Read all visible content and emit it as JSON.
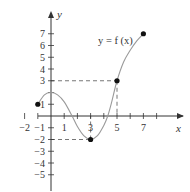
{
  "chart_data": {
    "type": "line",
    "title": "",
    "xlabel": "x",
    "ylabel": "y",
    "curve_label": "y = f (x)",
    "xlim": [
      -2.5,
      8.5
    ],
    "ylim": [
      -5.5,
      8
    ],
    "grid": false,
    "x_tick_labels": [
      "-2",
      "1",
      "3",
      "5",
      "7"
    ],
    "x_ticks": [
      -2,
      -1,
      1,
      2,
      3,
      4,
      5,
      6,
      7,
      8
    ],
    "y_tick_labels": [
      "7",
      "6",
      "5",
      "4",
      "3",
      "1",
      "-1",
      "-2",
      "-3",
      "-4",
      "-5"
    ],
    "y_ticks": [
      7,
      6,
      5,
      4,
      3,
      2,
      1,
      -1,
      -2,
      -3,
      -4,
      -5
    ],
    "curve_points": [
      {
        "x": -1,
        "y": 1
      },
      {
        "x": -0.5,
        "y": 1.8
      },
      {
        "x": 0,
        "y": 2
      },
      {
        "x": 0.5,
        "y": 1.8
      },
      {
        "x": 1,
        "y": 1.2
      },
      {
        "x": 1.6,
        "y": 0
      },
      {
        "x": 2,
        "y": -0.9
      },
      {
        "x": 2.5,
        "y": -1.7
      },
      {
        "x": 3,
        "y": -2
      },
      {
        "x": 3.5,
        "y": -1.7
      },
      {
        "x": 4,
        "y": -0.8
      },
      {
        "x": 4.3,
        "y": 0
      },
      {
        "x": 4.6,
        "y": 1.2
      },
      {
        "x": 5,
        "y": 3
      },
      {
        "x": 5.5,
        "y": 4.6
      },
      {
        "x": 6,
        "y": 5.6
      },
      {
        "x": 6.5,
        "y": 6.4
      },
      {
        "x": 7,
        "y": 7
      }
    ],
    "marked_points": [
      {
        "x": -1,
        "y": 1
      },
      {
        "x": 3,
        "y": -2
      },
      {
        "x": 5,
        "y": 3
      },
      {
        "x": 7,
        "y": 7
      }
    ],
    "dashed_guides": [
      {
        "from": {
          "x": 0,
          "y": 3
        },
        "to": {
          "x": 5,
          "y": 3
        }
      },
      {
        "from": {
          "x": 5,
          "y": 3
        },
        "to": {
          "x": 5,
          "y": 0
        }
      },
      {
        "from": {
          "x": 0,
          "y": -2
        },
        "to": {
          "x": 3,
          "y": -2
        }
      },
      {
        "from": {
          "x": 3,
          "y": -2
        },
        "to": {
          "x": 3,
          "y": 0
        }
      }
    ],
    "colors": {
      "axis": "#333333",
      "curve": "#9a9a9a",
      "dashes": "#666666",
      "points": "#111111"
    }
  }
}
